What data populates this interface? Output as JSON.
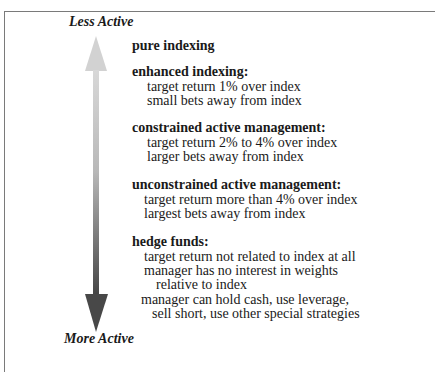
{
  "axis": {
    "top_label": "Less Active",
    "bottom_label": "More Active"
  },
  "colors": {
    "arrow_light": "#d4d4d4",
    "arrow_dark": "#4a4a4a",
    "border": "#7a7a7a",
    "text": "#1a1a1a"
  },
  "categories": [
    {
      "heading": "pure indexing",
      "lines": []
    },
    {
      "heading": "enhanced indexing:",
      "lines": [
        "target return 1% over index",
        "small bets away from index"
      ]
    },
    {
      "heading": "constrained active management:",
      "lines": [
        "target return  2% to 4% over index",
        "larger bets away from index"
      ]
    },
    {
      "heading": "unconstrained active management:",
      "lines": [
        "target return more than 4% over index",
        "largest bets away from index"
      ]
    },
    {
      "heading": "hedge funds:",
      "lines": [
        "target return not related to index at all",
        "manager has no interest in weights",
        "relative to index",
        "manager can hold cash, use leverage,",
        "sell short, use other special strategies"
      ]
    }
  ]
}
